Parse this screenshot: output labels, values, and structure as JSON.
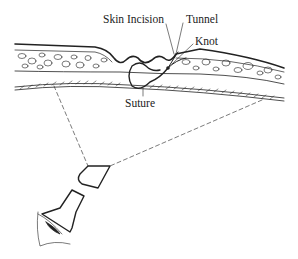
{
  "diagram": {
    "labels": {
      "skin_incision": "Skin Incision",
      "tunnel": "Tunnel",
      "knot": "Knot",
      "suture": "Suture"
    },
    "elements": [
      "skin-layer",
      "fat-layer",
      "fascia-layer",
      "suture-loop",
      "knot",
      "dashed-sight-lines",
      "scope",
      "eye"
    ],
    "colors": {
      "ink": "#222222",
      "background": "#ffffff"
    }
  }
}
